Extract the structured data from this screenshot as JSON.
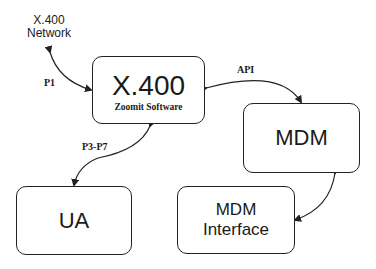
{
  "diagram": {
    "nodes": {
      "network": {
        "line1": "X.400",
        "line2": "Network"
      },
      "x400": {
        "title": "X.400",
        "subtitle": "Zoomit Software"
      },
      "mdm": {
        "title": "MDM"
      },
      "ua": {
        "title": "UA"
      },
      "mdm_interface": {
        "line1": "MDM",
        "line2": "Interface"
      }
    },
    "edges": {
      "p1": "P1",
      "api": "API",
      "p3p7": "P3-P7"
    },
    "colors": {
      "stroke": "#222222",
      "background": "#ffffff",
      "text": "#1a1a1a"
    }
  }
}
